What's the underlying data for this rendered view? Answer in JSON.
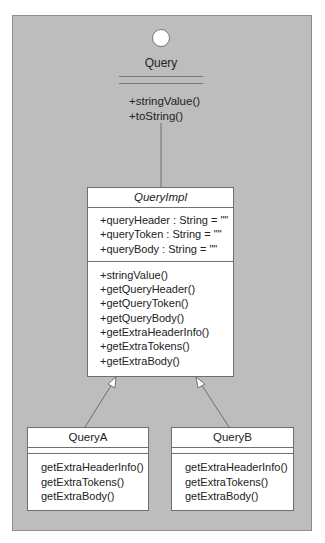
{
  "diagram": {
    "type": "UML class diagram",
    "interface": {
      "name": "Query",
      "stereotype_icon": "interface-lollipop-circle",
      "operations": [
        "+stringValue()",
        "+toString()"
      ]
    },
    "implementation": {
      "name": "QueryImpl",
      "attributes": [
        "+queryHeader : String = \"\"",
        "+queryToken : String = \"\"",
        "+queryBody : String = \"\""
      ],
      "operations": [
        "+stringValue()",
        "+getQueryHeader()",
        "+getQueryToken()",
        "+getQueryBody()",
        "+getExtraHeaderInfo()",
        "+getExtraTokens()",
        "+getExtraBody()"
      ]
    },
    "subclasses": [
      {
        "name": "QueryA",
        "operations": [
          "getExtraHeaderInfo()",
          "getExtraTokens()",
          "getExtraBody()"
        ]
      },
      {
        "name": "QueryB",
        "operations": [
          "getExtraHeaderInfo()",
          "getExtraTokens()",
          "getExtraBody()"
        ]
      }
    ],
    "relationships": [
      {
        "from": "QueryImpl",
        "to": "Query",
        "kind": "realization"
      },
      {
        "from": "QueryA",
        "to": "QueryImpl",
        "kind": "generalization"
      },
      {
        "from": "QueryB",
        "to": "QueryImpl",
        "kind": "generalization"
      }
    ],
    "colors": {
      "background": "#bdbdbd",
      "box_fill": "#ffffff",
      "stroke": "#6f6f6f"
    }
  }
}
